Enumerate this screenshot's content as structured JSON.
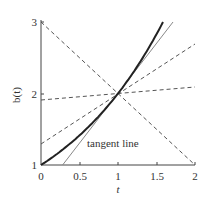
{
  "chart_data": {
    "type": "line",
    "title": "",
    "xlabel": "t",
    "ylabel": "b(t)",
    "xlim": [
      0,
      2
    ],
    "ylim": [
      1,
      3
    ],
    "x_ticks": [
      "0",
      "0.5",
      "1",
      "1.5",
      "2"
    ],
    "y_ticks": [
      "1",
      "2",
      "3"
    ],
    "grid": false,
    "annotations": [
      {
        "text": "tangent line",
        "x": 1.15,
        "y": 1.28
      }
    ],
    "series": [
      {
        "name": "b(t) = 2^t",
        "style": "solid-thick",
        "color": "#222222",
        "points": [
          [
            0,
            1
          ],
          [
            0.25,
            1.19
          ],
          [
            0.5,
            1.41
          ],
          [
            0.75,
            1.68
          ],
          [
            1,
            2
          ],
          [
            1.25,
            2.38
          ],
          [
            1.5,
            2.83
          ],
          [
            1.585,
            3
          ]
        ]
      },
      {
        "name": "tangent line",
        "style": "solid-thin",
        "color": "#888888",
        "points": [
          [
            0.28,
            1
          ],
          [
            1.72,
            3
          ]
        ]
      },
      {
        "name": "secant 1",
        "style": "dashed",
        "color": "#555555",
        "points": [
          [
            0,
            3
          ],
          [
            2,
            1
          ]
        ]
      },
      {
        "name": "secant 2",
        "style": "dashed",
        "color": "#555555",
        "points": [
          [
            0,
            1.3
          ],
          [
            2,
            2.7
          ]
        ]
      },
      {
        "name": "secant 3",
        "style": "dashed",
        "color": "#555555",
        "points": [
          [
            0,
            1.92
          ],
          [
            2,
            2.1
          ]
        ]
      }
    ]
  }
}
